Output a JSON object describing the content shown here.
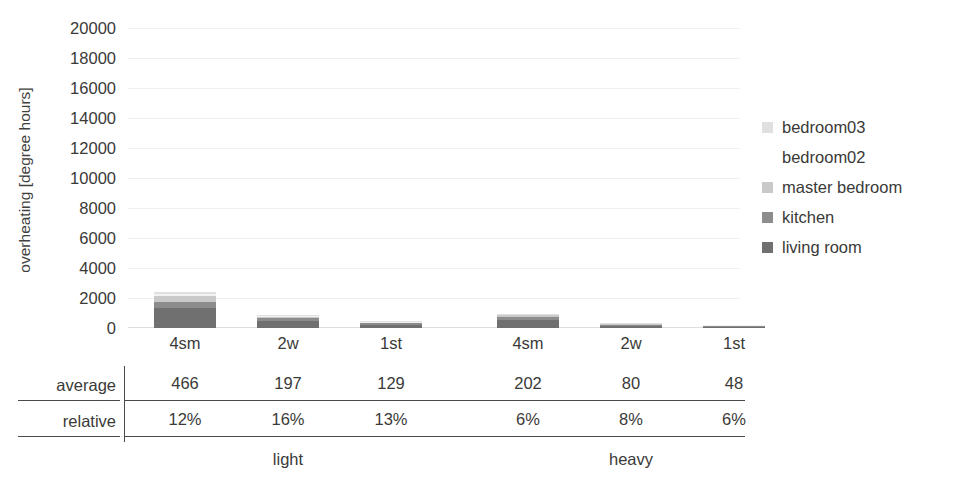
{
  "chart_data": {
    "type": "bar",
    "subtype": "stacked-bar",
    "title": "",
    "xlabel": "",
    "ylabel": "overheating [degree hours]",
    "ylim": [
      0,
      20000
    ],
    "ytick_step": 2000,
    "yticks": [
      "20000",
      "18000",
      "16000",
      "14000",
      "12000",
      "10000",
      "8000",
      "6000",
      "4000",
      "2000",
      "0"
    ],
    "grid": true,
    "legend_position": "right",
    "categories": [
      "4sm",
      "2w",
      "1st",
      "4sm",
      "2w",
      "1st"
    ],
    "groups": [
      {
        "label": "light",
        "categories": [
          "4sm",
          "2w",
          "1st"
        ]
      },
      {
        "label": "heavy",
        "categories": [
          "4sm",
          "2w",
          "1st"
        ]
      }
    ],
    "series": [
      {
        "name": "living room",
        "color": "#707070",
        "values": [
          1320,
          480,
          210,
          560,
          150,
          70
        ]
      },
      {
        "name": "kitchen",
        "color": "#8c8c8c",
        "values": [
          430,
          170,
          95,
          180,
          55,
          25
        ]
      },
      {
        "name": "master bedroom",
        "color": "#c9c9c9",
        "values": [
          360,
          110,
          60,
          110,
          30,
          10
        ]
      },
      {
        "name": "bedroom02",
        "color": "#f2f2f2",
        "values": [
          170,
          40,
          25,
          45,
          12,
          5
        ]
      },
      {
        "name": "bedroom03",
        "color": "#e0e0e0",
        "values": [
          120,
          30,
          20,
          35,
          8,
          3
        ]
      }
    ],
    "totals": [
      2400,
      830,
      410,
      930,
      255,
      113
    ],
    "table": {
      "rows": [
        {
          "label": "average",
          "values": [
            "466",
            "197",
            "129",
            "202",
            "80",
            "48"
          ]
        },
        {
          "label": "relative",
          "values": [
            "12%",
            "16%",
            "13%",
            "6%",
            "8%",
            "6%"
          ]
        }
      ]
    }
  },
  "legend": {
    "items": [
      {
        "label": "bedroom03",
        "color": "#e0e0e0",
        "swatch_visible": true
      },
      {
        "label": "bedroom02",
        "color": "#ffffff",
        "swatch_visible": false
      },
      {
        "label": "master bedroom",
        "color": "#c9c9c9",
        "swatch_visible": true
      },
      {
        "label": "kitchen",
        "color": "#8c8c8c",
        "swatch_visible": true
      },
      {
        "label": "living room",
        "color": "#707070",
        "swatch_visible": true
      }
    ]
  },
  "axis": {
    "y_title": "overheating [degree hours]"
  },
  "title_remnant": ""
}
